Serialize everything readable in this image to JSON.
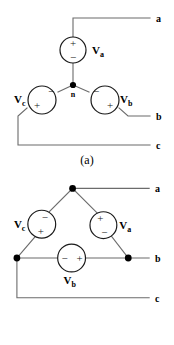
{
  "figure_a": {
    "caption": "(a)",
    "type": "wye-connected-three-phase-source",
    "neutral_node_label": "n",
    "terminals": [
      {
        "name": "a",
        "label": "a"
      },
      {
        "name": "b",
        "label": "b"
      },
      {
        "name": "c",
        "label": "c"
      }
    ],
    "sources": [
      {
        "name": "Va",
        "label": "V",
        "subscript": "a",
        "plus": "+",
        "minus": "−",
        "plus_position": "top",
        "minus_position": "bottom",
        "label_position": "right"
      },
      {
        "name": "Vb",
        "label": "V",
        "subscript": "b",
        "plus": "+",
        "minus": "−",
        "plus_position": "lower-right",
        "minus_position": "upper-left",
        "label_position": "right"
      },
      {
        "name": "Vc",
        "label": "V",
        "subscript": "c",
        "plus": "+",
        "minus": "−",
        "plus_position": "lower-left",
        "minus_position": "upper-right",
        "label_position": "left"
      }
    ]
  },
  "figure_b": {
    "caption": "(b)",
    "type": "delta-connected-three-phase-source",
    "terminals": [
      {
        "name": "a",
        "label": "a"
      },
      {
        "name": "b",
        "label": "b"
      },
      {
        "name": "c",
        "label": "c"
      }
    ],
    "sources": [
      {
        "name": "Va",
        "label": "V",
        "subscript": "a",
        "plus": "+",
        "minus": "−",
        "plus_position": "top",
        "minus_position": "bottom",
        "label_position": "right"
      },
      {
        "name": "Vb",
        "label": "V",
        "subscript": "b",
        "plus": "+",
        "minus": "−",
        "plus_position": "right",
        "minus_position": "left",
        "label_position": "below"
      },
      {
        "name": "Vc",
        "label": "V",
        "subscript": "c",
        "plus": "+",
        "minus": "−",
        "plus_position": "bottom",
        "minus_position": "top",
        "label_position": "left"
      }
    ]
  },
  "colors": {
    "wire": "#6b6b6b",
    "symbol": "#1a1a1a",
    "text": "#000000",
    "background": "#ffffff"
  }
}
